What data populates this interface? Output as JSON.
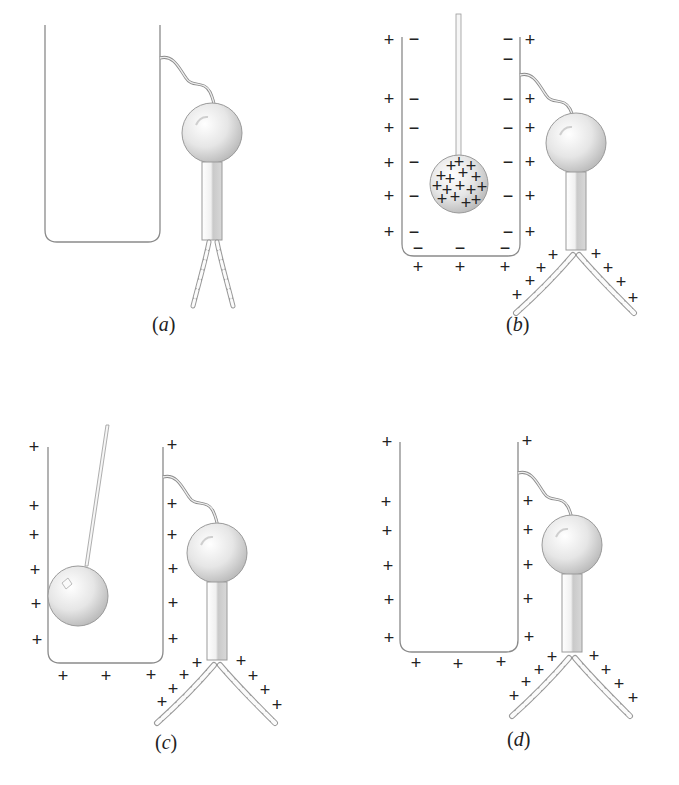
{
  "figure": {
    "panels": [
      {
        "id": "a",
        "label": "(a)",
        "label_letter": "a",
        "state": "uncharged pail connected to electroscope, leaves collapsed"
      },
      {
        "id": "b",
        "label": "(b)",
        "label_letter": "b",
        "state": "positively charged ball lowered inside pail; inner wall negative, outer wall positive, leaves diverge"
      },
      {
        "id": "c",
        "label": "(c)",
        "label_letter": "c",
        "state": "ball touches inside wall; charge moves to outer surface, leaves stay diverged"
      },
      {
        "id": "d",
        "label": "(d)",
        "label_letter": "d",
        "state": "ball removed; pail outer surface and electroscope remain positive"
      }
    ],
    "symbols": {
      "positive": "+",
      "negative": "−"
    },
    "colors": {
      "line": "#8a8a8a",
      "ink": "#222222",
      "ball_light": "#f4f4f4",
      "ball_dark": "#bdbdbd",
      "background": "#ffffff"
    }
  }
}
